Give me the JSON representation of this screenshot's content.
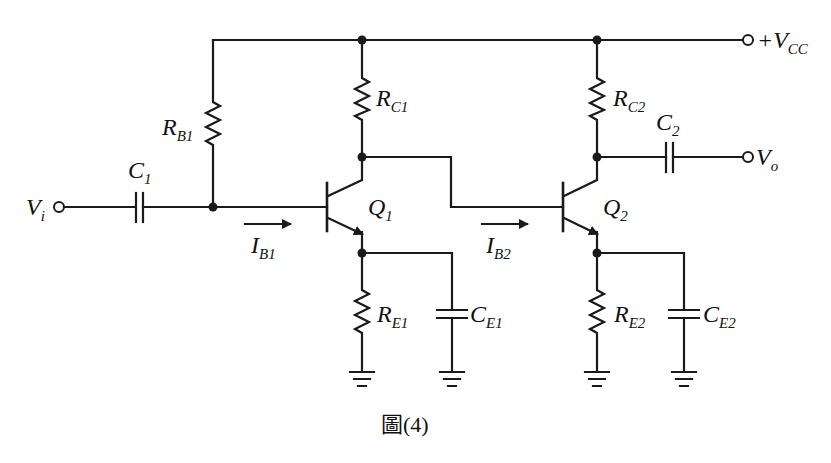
{
  "figure": {
    "caption": "圖(4)"
  },
  "labels": {
    "vcc": {
      "main": "+V",
      "sub": "CC"
    },
    "vi": {
      "main": "V",
      "sub": "i"
    },
    "vo": {
      "main": "V",
      "sub": "o"
    },
    "rb1": {
      "main": "R",
      "sub": "B1"
    },
    "rc1": {
      "main": "R",
      "sub": "C1"
    },
    "rc2": {
      "main": "R",
      "sub": "C2"
    },
    "re1": {
      "main": "R",
      "sub": "E1"
    },
    "re2": {
      "main": "R",
      "sub": "E2"
    },
    "c1": {
      "main": "C",
      "sub": "1"
    },
    "c2": {
      "main": "C",
      "sub": "2"
    },
    "ce1": {
      "main": "C",
      "sub": "E1"
    },
    "ce2": {
      "main": "C",
      "sub": "E2"
    },
    "q1": {
      "main": "Q",
      "sub": "1"
    },
    "q2": {
      "main": "Q",
      "sub": "2"
    },
    "ib1": {
      "main": "I",
      "sub": "B1"
    },
    "ib2": {
      "main": "I",
      "sub": "B2"
    }
  },
  "colors": {
    "wire": "#1a1a1a",
    "background": "#ffffff"
  }
}
